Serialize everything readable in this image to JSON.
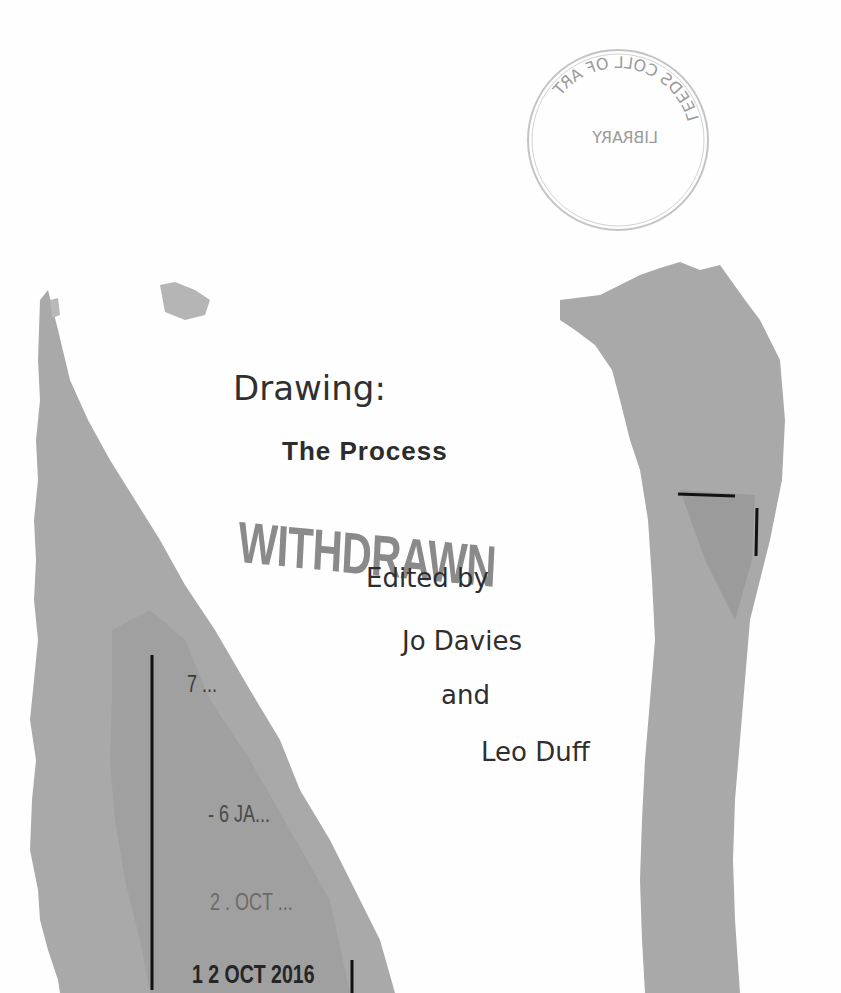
{
  "document": {
    "type": "scanned book title page",
    "colors": {
      "paper": "#fefefe",
      "torn_overlay_gray": "#a8a8a8",
      "tape_gray": "#9e9e9e",
      "text": "#2e2e2e",
      "withdrawn_stamp": "#8a8a8a"
    }
  },
  "title_page": {
    "title": "Drawing:",
    "subtitle": "The Process",
    "editor_prefix": "Edited by",
    "editor_1": "Jo Davies",
    "conjunction": "and",
    "editor_2": "Leo Duff"
  },
  "stamps": {
    "withdrawn": "WITHDRAWN",
    "library_seal": {
      "ring_text": "LEEDS COLL OF ART",
      "center_text": "LIBRARY",
      "mirrored": true
    },
    "due_dates": [
      "7 ...",
      "- 6 JA...",
      "2 . OCT ...",
      "1 2 OCT 2016"
    ]
  }
}
